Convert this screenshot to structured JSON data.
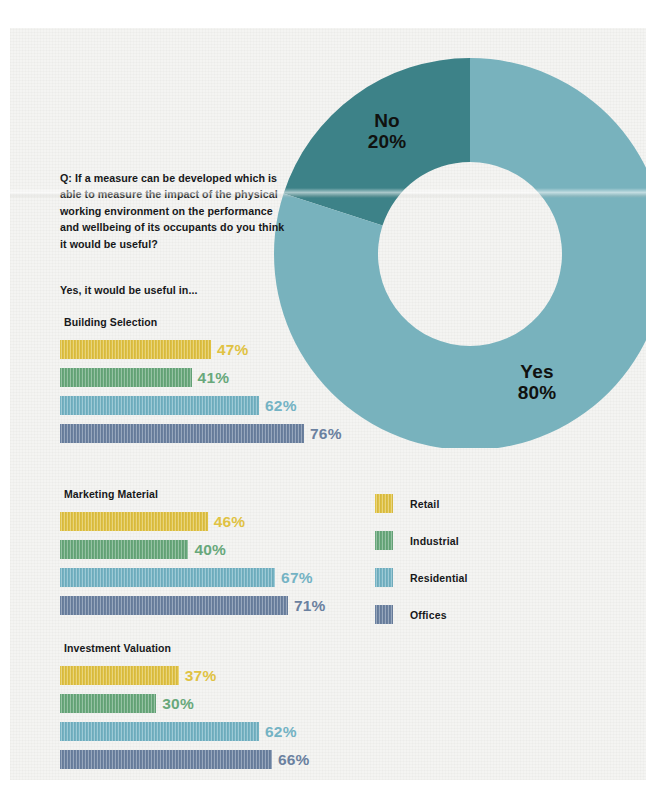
{
  "question": {
    "text": "Q: If a measure can be developed which is able to measure the impact of the physical working environment on the performance and wellbeing of its occupants do you think it would be useful?"
  },
  "subhead": {
    "text": "Yes, it would be useful in..."
  },
  "donut": {
    "yes_label": "Yes",
    "yes_value": "80%",
    "no_label": "No",
    "no_value": "20%",
    "yes_color": "#78b2bd",
    "no_color": "#3d8288"
  },
  "legend": {
    "items": [
      {
        "label": "Retail",
        "color": "#e0c243"
      },
      {
        "label": "Industrial",
        "color": "#68a87b"
      },
      {
        "label": "Residential",
        "color": "#74b3c4"
      },
      {
        "label": "Offices",
        "color": "#6b81a0"
      }
    ]
  },
  "sections": [
    {
      "title": "Building Selection",
      "bars": [
        {
          "category": "Retail",
          "value": 47,
          "label": "47%",
          "color": "#e0c243"
        },
        {
          "category": "Industrial",
          "value": 41,
          "label": "41%",
          "color": "#68a87b"
        },
        {
          "category": "Residential",
          "value": 62,
          "label": "62%",
          "color": "#74b3c4"
        },
        {
          "category": "Offices",
          "value": 76,
          "label": "76%",
          "color": "#6b81a0"
        }
      ]
    },
    {
      "title": "Marketing Material",
      "bars": [
        {
          "category": "Retail",
          "value": 46,
          "label": "46%",
          "color": "#e0c243"
        },
        {
          "category": "Industrial",
          "value": 40,
          "label": "40%",
          "color": "#68a87b"
        },
        {
          "category": "Residential",
          "value": 67,
          "label": "67%",
          "color": "#74b3c4"
        },
        {
          "category": "Offices",
          "value": 71,
          "label": "71%",
          "color": "#6b81a0"
        }
      ]
    },
    {
      "title": "Investment Valuation",
      "bars": [
        {
          "category": "Retail",
          "value": 37,
          "label": "37%",
          "color": "#e0c243"
        },
        {
          "category": "Industrial",
          "value": 30,
          "label": "30%",
          "color": "#68a87b"
        },
        {
          "category": "Residential",
          "value": 62,
          "label": "62%",
          "color": "#74b3c4"
        },
        {
          "category": "Offices",
          "value": 66,
          "label": "66%",
          "color": "#6b81a0"
        }
      ]
    }
  ],
  "chart_data": [
    {
      "type": "pie",
      "title": "Q: If a measure can be developed which is able to measure the impact of the physical working environment on the performance and wellbeing of its occupants do you think it would be useful?",
      "labels": [
        "Yes",
        "No"
      ],
      "values": [
        80,
        20
      ],
      "unit": "%",
      "colors": [
        "#78b2bd",
        "#3d8288"
      ],
      "donut": true,
      "annotations": [
        "Yes 80%",
        "No 20%"
      ],
      "legend_position": "none"
    },
    {
      "type": "bar",
      "title": "Yes, it would be useful in... — Building Selection",
      "orientation": "horizontal",
      "categories": [
        "Retail",
        "Industrial",
        "Residential",
        "Offices"
      ],
      "values": [
        47,
        41,
        62,
        76
      ],
      "xlabel": "",
      "ylabel": "",
      "xlim": [
        0,
        100
      ],
      "unit": "%",
      "grid": false,
      "legend_position": "right"
    },
    {
      "type": "bar",
      "title": "Yes, it would be useful in... — Marketing Material",
      "orientation": "horizontal",
      "categories": [
        "Retail",
        "Industrial",
        "Residential",
        "Offices"
      ],
      "values": [
        46,
        40,
        67,
        71
      ],
      "xlabel": "",
      "ylabel": "",
      "xlim": [
        0,
        100
      ],
      "unit": "%",
      "grid": false,
      "legend_position": "right"
    },
    {
      "type": "bar",
      "title": "Yes, it would be useful in... — Investment Valuation",
      "orientation": "horizontal",
      "categories": [
        "Retail",
        "Industrial",
        "Residential",
        "Offices"
      ],
      "values": [
        37,
        30,
        62,
        66
      ],
      "xlabel": "",
      "ylabel": "",
      "xlim": [
        0,
        100
      ],
      "unit": "%",
      "grid": false,
      "legend_position": "right"
    }
  ]
}
